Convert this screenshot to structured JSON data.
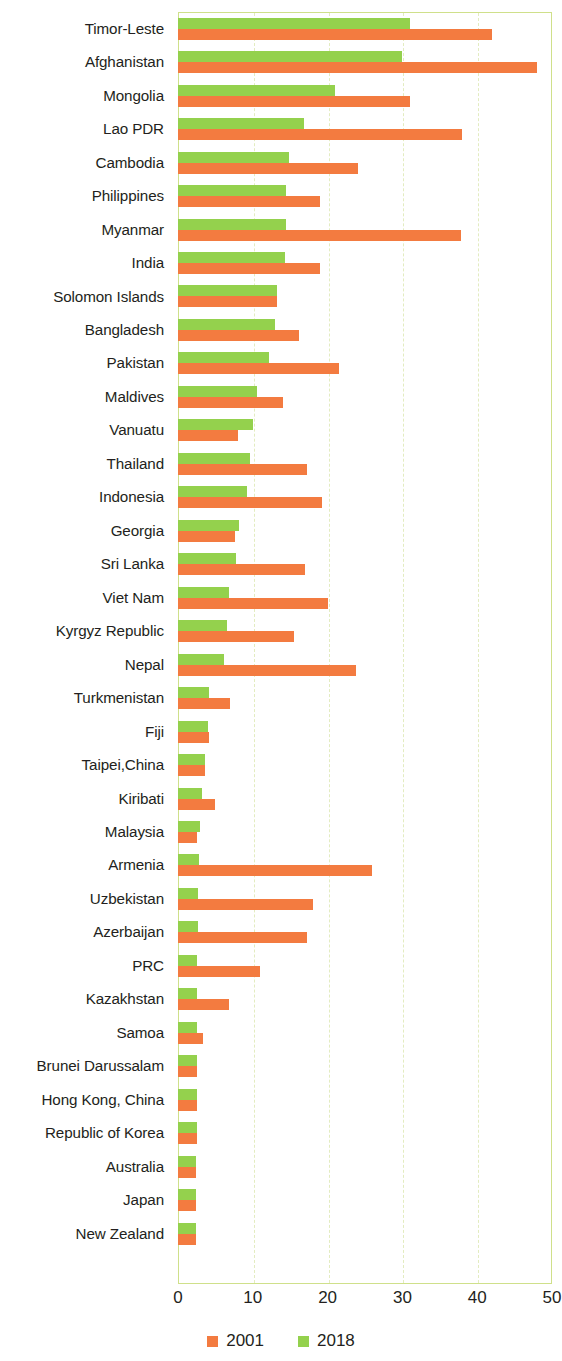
{
  "chart_data": {
    "type": "bar",
    "orientation": "horizontal",
    "title": "",
    "subtitle": "",
    "xlabel": "",
    "ylabel": "",
    "xlim": [
      0,
      50
    ],
    "xticks": [
      0,
      10,
      20,
      30,
      40,
      50
    ],
    "xtick_labels": [
      "0",
      "10",
      "20",
      "30",
      "40",
      "50"
    ],
    "grid": true,
    "grid_axis": "x",
    "legend_position": "bottom",
    "colors": {
      "2001": "#f37b40",
      "2018": "#94d14d",
      "frame": "#cfe08a",
      "gridline": "#e3ecc0",
      "text": "#231f20",
      "background": "#ffffff"
    },
    "legend": [
      {
        "label": "2001",
        "color": "#f37b40"
      },
      {
        "label": "2018",
        "color": "#94d14d"
      }
    ],
    "categories": [
      "Timor-Leste",
      "Afghanistan",
      "Mongolia",
      "Lao PDR",
      "Cambodia",
      "Philippines",
      "Myanmar",
      "India",
      "Solomon Islands",
      "Bangladesh",
      "Pakistan",
      "Maldives",
      "Vanuatu",
      "Thailand",
      "Indonesia",
      "Georgia",
      "Sri Lanka",
      "Viet Nam",
      "Kyrgyz Republic",
      "Nepal",
      "Turkmenistan",
      "Fiji",
      "Taipei,China",
      "Kiribati",
      "Malaysia",
      "Armenia",
      "Uzbekistan",
      "Azerbaijan",
      "PRC",
      "Kazakhstan",
      "Samoa",
      "Brunei Darussalam",
      "Hong Kong, China",
      "Republic of Korea",
      "Australia",
      "Japan",
      "New Zealand"
    ],
    "series": [
      {
        "name": "2001",
        "color": "#f37b40",
        "values": [
          42.0,
          48.0,
          31.0,
          38.0,
          24.0,
          19.0,
          37.8,
          19.0,
          13.2,
          16.2,
          21.5,
          14.0,
          8.0,
          17.2,
          19.2,
          7.6,
          17.0,
          20.0,
          15.5,
          23.8,
          7.0,
          4.2,
          3.6,
          5.0,
          2.6,
          26.0,
          18.0,
          17.2,
          11.0,
          6.8,
          3.4,
          2.5,
          2.5,
          2.5,
          2.4,
          2.4,
          2.4
        ]
      },
      {
        "name": "2018",
        "color": "#94d14d",
        "values": [
          31.0,
          30.0,
          21.0,
          16.8,
          14.8,
          14.5,
          14.4,
          14.3,
          13.2,
          13.0,
          12.2,
          10.5,
          10.0,
          9.6,
          9.2,
          8.2,
          7.8,
          6.8,
          6.6,
          6.2,
          4.2,
          4.0,
          3.6,
          3.2,
          3.0,
          2.8,
          2.7,
          2.7,
          2.6,
          2.5,
          2.5,
          2.5,
          2.5,
          2.5,
          2.4,
          2.4,
          2.4
        ]
      }
    ]
  }
}
